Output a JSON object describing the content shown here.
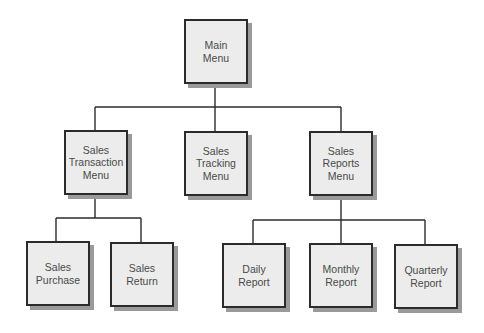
{
  "diagram": {
    "type": "hierarchy-chart",
    "colors": {
      "box_fill": "#ececec",
      "box_border": "#2b2b2b",
      "shadow": "#9a9a9a",
      "line": "#2b2b2b",
      "text": "#4a4a4a"
    },
    "root": {
      "id": "main",
      "label": "Main\nMenu"
    },
    "level2": [
      {
        "id": "sales-transaction",
        "label": "Sales\nTransaction\nMenu"
      },
      {
        "id": "sales-tracking",
        "label": "Sales\nTracking\nMenu"
      },
      {
        "id": "sales-reports",
        "label": "Sales\nReports\nMenu"
      }
    ],
    "level3": [
      {
        "id": "sales-purchase",
        "parent": "sales-transaction",
        "label": "Sales\nPurchase"
      },
      {
        "id": "sales-return",
        "parent": "sales-transaction",
        "label": "Sales\nReturn"
      },
      {
        "id": "daily-report",
        "parent": "sales-reports",
        "label": "Daily\nReport"
      },
      {
        "id": "monthly-report",
        "parent": "sales-reports",
        "label": "Monthly\nReport"
      },
      {
        "id": "quarterly-report",
        "parent": "sales-reports",
        "label": "Quarterly\nReport"
      }
    ]
  }
}
